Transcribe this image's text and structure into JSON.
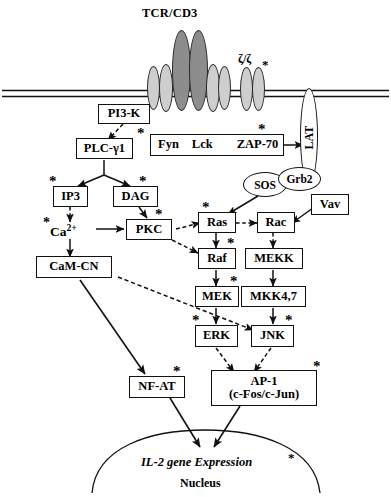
{
  "diagram": {
    "title": "TCR/CD3",
    "zeta_label": "ζ/ζ",
    "nucleus_label": "Nucleus",
    "il2_label": "IL-2 gene Expression",
    "membrane": "plasma-membrane-double-line",
    "colors": {
      "stroke": "#111111",
      "background": "#ffffff",
      "tcr_subunit_dark": "#8d8d8d",
      "cd3_subunit_light": "#cecece"
    }
  },
  "nodes": {
    "pi3k": {
      "label": "PI3-K",
      "shape": "box"
    },
    "plcg1": {
      "label": "PLC-γ1",
      "shape": "box",
      "activated": true
    },
    "kinases": {
      "label": "Fyn   Lck",
      "shape": "box"
    },
    "fyn": {
      "label": "Fyn"
    },
    "lck": {
      "label": "Lck"
    },
    "zap70": {
      "label": "ZAP-70",
      "shape": "box",
      "activated": true
    },
    "lat": {
      "label": "LAT",
      "shape": "vertical-oval"
    },
    "ip3": {
      "label": "IP3",
      "shape": "box",
      "activated": true
    },
    "dag": {
      "label": "DAG",
      "shape": "box",
      "activated": true
    },
    "ca": {
      "label": "Ca2+",
      "shape": "plain",
      "activated": true
    },
    "pkc": {
      "label": "PKC",
      "shape": "box",
      "activated": true
    },
    "camcn": {
      "label": "CaM-CN",
      "shape": "box"
    },
    "sos": {
      "label": "SOS",
      "shape": "oval"
    },
    "grb2": {
      "label": "Grb2",
      "shape": "oval"
    },
    "vav": {
      "label": "Vav",
      "shape": "box"
    },
    "ras": {
      "label": "Ras",
      "shape": "box",
      "activated": true
    },
    "rac": {
      "label": "Rac",
      "shape": "box"
    },
    "raf": {
      "label": "Raf",
      "shape": "box",
      "activated": true
    },
    "mekk": {
      "label": "MEKK",
      "shape": "box"
    },
    "mek": {
      "label": "MEK",
      "shape": "box",
      "activated": true
    },
    "mkk47": {
      "label": "MKK4,7",
      "shape": "box"
    },
    "erk": {
      "label": "ERK",
      "shape": "box",
      "activated": true
    },
    "jnk": {
      "label": "JNK",
      "shape": "box",
      "activated": true
    },
    "nfat": {
      "label": "NF-AT",
      "shape": "box",
      "activated": true
    },
    "ap1": {
      "label": "AP-1",
      "sublabel": "(c-Fos/c-Jun)",
      "shape": "box",
      "activated": true
    }
  },
  "markers": {
    "asterisk": "*"
  }
}
